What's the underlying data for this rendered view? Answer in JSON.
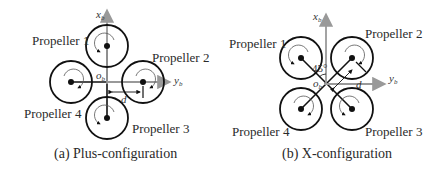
{
  "panels": [
    {
      "id": "a",
      "caption": "(a)  Plus-configuration",
      "propellers": [
        "Propeller 1",
        "Propeller 2",
        "Propeller 3",
        "Propeller 4"
      ],
      "axis_x": "x",
      "axis_x_sub": "b",
      "axis_y": "y",
      "axis_y_sub": "b",
      "origin": "o",
      "origin_sub": "b",
      "arm_label": "d"
    },
    {
      "id": "b",
      "caption": "(b)  X-configuration",
      "propellers": [
        "Propeller 1",
        "Propeller 2",
        "Propeller 3",
        "Propeller 4"
      ],
      "axis_x": "x",
      "axis_x_sub": "b",
      "axis_y": "y",
      "axis_y_sub": "b",
      "origin": "o",
      "origin_sub": "b",
      "angle_label": "45°",
      "arm_label": "d"
    }
  ],
  "colors": {
    "axis": "#999999",
    "line": "#1a1a1a"
  }
}
